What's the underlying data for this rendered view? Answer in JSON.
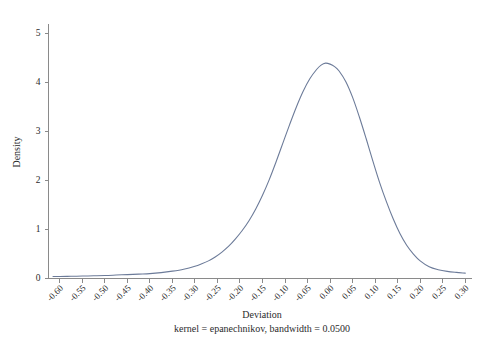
{
  "chart_data": {
    "type": "line",
    "title": "",
    "subtitle": "",
    "xlabel": "Deviation",
    "ylabel": "Density",
    "note": "kernel = epanechnikov, bandwidth = 0.0500",
    "grid": false,
    "legend": false,
    "legend_position": "none",
    "series_color": "#6c7b99",
    "xlim": [
      -0.625,
      0.315
    ],
    "ylim": [
      0,
      5.2
    ],
    "xticks": [
      -0.6,
      -0.55,
      -0.5,
      -0.45,
      -0.4,
      -0.35,
      -0.3,
      -0.25,
      -0.2,
      -0.15,
      -0.1,
      -0.05,
      0.0,
      0.05,
      0.1,
      0.15,
      0.2,
      0.25,
      0.3
    ],
    "xtick_labels": [
      "-0.60",
      "-0.55",
      "-0.50",
      "-0.45",
      "-0.40",
      "-0.35",
      "-0.30",
      "-0.25",
      "-0.20",
      "-0.15",
      "-0.10",
      "-0.05",
      "0.00",
      "0.05",
      "0.10",
      "0.15",
      "0.20",
      "0.25",
      "0.30"
    ],
    "yticks": [
      0,
      1,
      2,
      3,
      4,
      5
    ],
    "ytick_labels": [
      "0",
      "1",
      "2",
      "3",
      "4",
      "5"
    ],
    "series": [
      {
        "name": "Density",
        "x": [
          -0.615,
          -0.6,
          -0.575,
          -0.55,
          -0.525,
          -0.5,
          -0.475,
          -0.45,
          -0.425,
          -0.4,
          -0.375,
          -0.35,
          -0.325,
          -0.3,
          -0.285,
          -0.27,
          -0.255,
          -0.24,
          -0.225,
          -0.21,
          -0.195,
          -0.18,
          -0.165,
          -0.15,
          -0.135,
          -0.12,
          -0.105,
          -0.09,
          -0.075,
          -0.06,
          -0.045,
          -0.03,
          -0.02,
          -0.01,
          0.0,
          0.01,
          0.02,
          0.035,
          0.05,
          0.065,
          0.08,
          0.095,
          0.11,
          0.125,
          0.14,
          0.155,
          0.17,
          0.185,
          0.2,
          0.22,
          0.24,
          0.26,
          0.28,
          0.3
        ],
        "y": [
          0.04,
          0.04,
          0.045,
          0.05,
          0.055,
          0.06,
          0.07,
          0.08,
          0.09,
          0.1,
          0.12,
          0.15,
          0.19,
          0.25,
          0.3,
          0.36,
          0.44,
          0.54,
          0.66,
          0.81,
          0.98,
          1.18,
          1.42,
          1.7,
          2.02,
          2.38,
          2.76,
          3.14,
          3.5,
          3.82,
          4.08,
          4.27,
          4.36,
          4.4,
          4.38,
          4.33,
          4.24,
          4.02,
          3.7,
          3.3,
          2.86,
          2.4,
          1.96,
          1.57,
          1.22,
          0.92,
          0.68,
          0.5,
          0.36,
          0.24,
          0.18,
          0.145,
          0.125,
          0.11
        ]
      }
    ]
  }
}
